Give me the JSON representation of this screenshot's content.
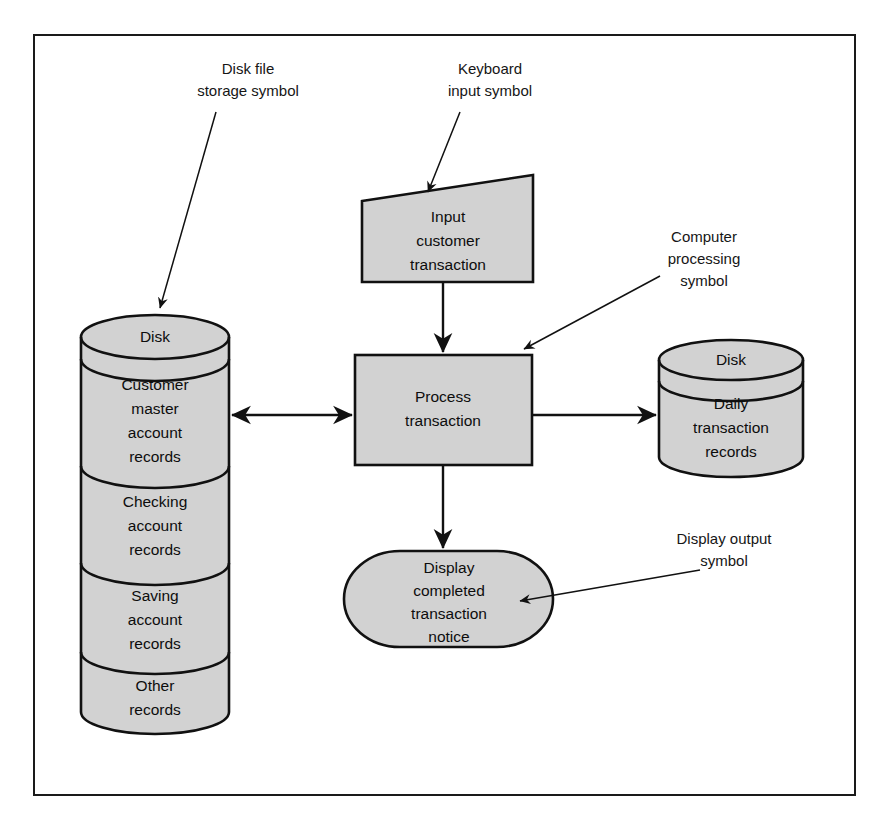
{
  "diagram": {
    "frame_border_color": "#1a1a1a",
    "shape_fill_color": "#d2d2d2",
    "line_color": "#111111",
    "caption_fragment": ""
  },
  "nodes": {
    "disk_left": {
      "header": "Disk",
      "segments": [
        {
          "lines": [
            "Customer",
            "master",
            "account",
            "records"
          ]
        },
        {
          "lines": [
            "Checking",
            "account",
            "records"
          ]
        },
        {
          "lines": [
            "Saving",
            "account",
            "records"
          ]
        },
        {
          "lines": [
            "Other",
            "records"
          ]
        }
      ]
    },
    "input": {
      "lines": [
        "Input",
        "customer",
        "transaction"
      ]
    },
    "process": {
      "lines": [
        "Process",
        "transaction"
      ]
    },
    "disk_right": {
      "header": "Disk",
      "lines": [
        "Daily",
        "transaction",
        "records"
      ]
    },
    "display": {
      "lines": [
        "Display",
        "completed",
        "transaction",
        "notice"
      ]
    }
  },
  "annotations": {
    "disk_file": {
      "lines": [
        "Disk file",
        "storage symbol"
      ]
    },
    "keyboard": {
      "lines": [
        "Keyboard",
        "input symbol"
      ]
    },
    "computer": {
      "lines": [
        "Computer",
        "processing",
        "symbol"
      ]
    },
    "display_output": {
      "lines": [
        "Display output",
        "symbol"
      ]
    }
  },
  "connectors": [
    {
      "name": "input-to-process",
      "arrowheads": "end"
    },
    {
      "name": "disk-left-to-process",
      "arrowheads": "both"
    },
    {
      "name": "process-to-disk-right",
      "arrowheads": "end"
    },
    {
      "name": "process-to-display",
      "arrowheads": "end"
    },
    {
      "name": "annotation-disk-file-leader",
      "arrowheads": "end"
    },
    {
      "name": "annotation-keyboard-leader",
      "arrowheads": "end"
    },
    {
      "name": "annotation-computer-leader",
      "arrowheads": "end"
    },
    {
      "name": "annotation-display-output-leader",
      "arrowheads": "end"
    }
  ]
}
